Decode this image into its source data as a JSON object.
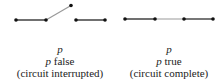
{
  "diagrams": [
    {
      "state": "open",
      "variable": "p",
      "label_var": "p",
      "label_value": "false",
      "note": "(circuit interrupted)",
      "line_color": "#333333",
      "switch_color": "#999999"
    },
    {
      "state": "closed",
      "variable": "p",
      "label_var": "p",
      "label_value": "true",
      "note": "(circuit complete)",
      "line_color": "#333333",
      "switch_color": "#aaaaaa"
    }
  ]
}
